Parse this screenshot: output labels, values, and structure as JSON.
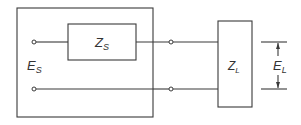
{
  "diagram": {
    "type": "circuit",
    "source": {
      "voltage_label": "E",
      "voltage_subscript": "S",
      "impedance_label": "Z",
      "impedance_subscript": "S"
    },
    "load": {
      "impedance_label": "Z",
      "impedance_subscript": "L",
      "voltage_label": "E",
      "voltage_subscript": "L"
    },
    "colors": {
      "line": "#3a3a3a",
      "background": "#ffffff"
    }
  }
}
